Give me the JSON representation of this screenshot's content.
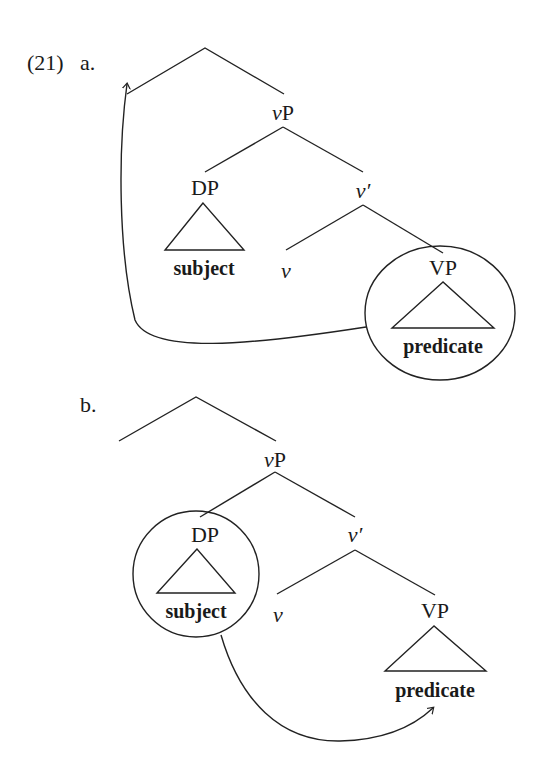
{
  "example_number": "(21)",
  "trees": [
    {
      "label": "a.",
      "nodes": {
        "vP": "vP",
        "vP_italic": "v",
        "vP_rest": "P",
        "DP": "DP",
        "v_bar": "v′",
        "v": "v",
        "VP": "VP"
      },
      "terminals": {
        "subject": "subject",
        "predicate": "predicate"
      },
      "circled": "VP",
      "arrow": "VP (predicate) moves to left edge of top branch"
    },
    {
      "label": "b.",
      "nodes": {
        "vP": "vP",
        "vP_italic": "v",
        "vP_rest": "P",
        "DP": "DP",
        "v_bar": "v′",
        "v": "v",
        "VP": "VP"
      },
      "terminals": {
        "subject": "subject",
        "predicate": "predicate"
      },
      "circled": "DP",
      "arrow": "DP (subject) moves to predicate"
    }
  ]
}
